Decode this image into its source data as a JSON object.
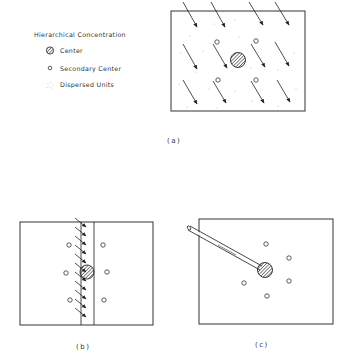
{
  "legend": {
    "title": "Hierarchical Concentration",
    "items": [
      {
        "icon": "hatched-circle-icon",
        "label": "Center"
      },
      {
        "icon": "open-circle-icon",
        "label": "Secondary Center"
      },
      {
        "icon": "dot-cluster-icon",
        "label": "Dispersed Units"
      }
    ]
  },
  "panels": [
    {
      "id": "a",
      "caption": "(a)"
    },
    {
      "id": "b",
      "caption": "(b)"
    },
    {
      "id": "c",
      "caption": "(c)"
    }
  ],
  "colors": {
    "stroke": "#333333",
    "background": "#ffffff"
  }
}
